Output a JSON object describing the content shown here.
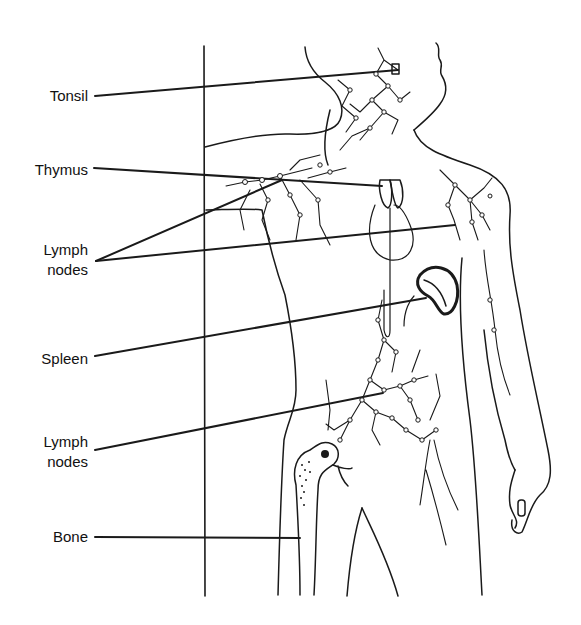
{
  "diagram": {
    "labels": [
      {
        "id": "tonsil",
        "lines": [
          "Tonsil"
        ]
      },
      {
        "id": "thymus",
        "lines": [
          "Thymus"
        ]
      },
      {
        "id": "lymph-nodes-upper",
        "lines": [
          "Lymph",
          "nodes"
        ]
      },
      {
        "id": "spleen",
        "lines": [
          "Spleen"
        ]
      },
      {
        "id": "lymph-nodes-lower",
        "lines": [
          "Lymph",
          "nodes"
        ]
      },
      {
        "id": "bone",
        "lines": [
          "Bone"
        ]
      }
    ],
    "colors": {
      "background": "#ffffff",
      "ink": "#1a1a1a"
    }
  }
}
